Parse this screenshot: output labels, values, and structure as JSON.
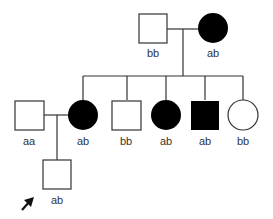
{
  "diagram": {
    "type": "pedigree",
    "generation_1": [
      {
        "sex": "male",
        "affected": false,
        "genotype": "bb"
      },
      {
        "sex": "female",
        "affected": true,
        "genotype": "ab"
      }
    ],
    "generation_2": [
      {
        "sex": "male",
        "affected": false,
        "genotype": "aa",
        "married_in": true
      },
      {
        "sex": "female",
        "affected": true,
        "genotype": "ab"
      },
      {
        "sex": "male",
        "affected": false,
        "genotype": "bb"
      },
      {
        "sex": "female",
        "affected": true,
        "genotype": "ab"
      },
      {
        "sex": "male",
        "affected": true,
        "genotype": "ab"
      },
      {
        "sex": "female",
        "affected": false,
        "genotype": "bb"
      }
    ],
    "generation_3": [
      {
        "sex": "male",
        "affected": false,
        "genotype": "ab",
        "proband": true
      }
    ]
  },
  "labels": {
    "g1_father": "bb",
    "g1_mother": "ab",
    "g2_husband": "aa",
    "g2_daughter1": "ab",
    "g2_son1": "bb",
    "g2_daughter2": "ab",
    "g2_son2": "ab",
    "g2_daughter3": "bb",
    "g3_son": "ab"
  },
  "colors": {
    "line": "#333333",
    "affected_fill": "#000000",
    "unaffected_fill": "#ffffff"
  }
}
